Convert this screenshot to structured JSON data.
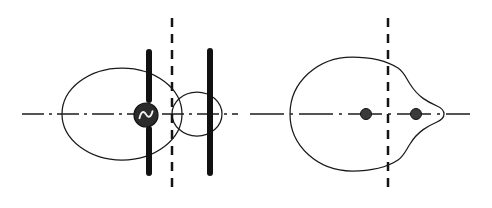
{
  "figure": {
    "background_color": "#ffffff",
    "width": 492,
    "height": 208,
    "stroke_color": "#1a1a1a",
    "electrode_color": "#111111",
    "dot_color": "#3a3a3a",
    "source_fill": "#2b2b2b",
    "source_wave_color": "#f2f2f2"
  },
  "panels": [
    {
      "id": "left-panel",
      "name": "ac-source-electrode-panel",
      "label": "AC source between split electrodes",
      "axis": {
        "name": "horizontal-axis",
        "style": "dash-dot",
        "y": 114,
        "x_start": 22,
        "x_end": 238
      },
      "symmetry_line": {
        "name": "symmetry-axis",
        "style": "dashed",
        "x": 172,
        "y_start": 18,
        "y_end": 192
      },
      "elements": [
        {
          "name": "large-oval-contour",
          "type": "oval",
          "cx": 122,
          "cy": 114,
          "rx": 60,
          "ry": 46
        },
        {
          "name": "small-lens-contour",
          "type": "oval",
          "cx": 197,
          "cy": 114,
          "rx": 25,
          "ry": 22
        },
        {
          "name": "upper-left-electrode",
          "type": "bar",
          "x": 149,
          "y_top": 49,
          "y_bottom": 103,
          "thickness": 6
        },
        {
          "name": "lower-left-electrode",
          "type": "bar",
          "x": 149,
          "y_top": 126,
          "y_bottom": 176,
          "thickness": 6
        },
        {
          "name": "right-electrode",
          "type": "bar",
          "x": 210,
          "y_top": 48,
          "y_bottom": 176,
          "thickness": 6
        },
        {
          "name": "ac-source-symbol",
          "type": "ac-source",
          "cx": 146,
          "cy": 115,
          "r": 12,
          "glyph": "sine-wave"
        }
      ]
    },
    {
      "id": "right-panel",
      "name": "equipotential-contour-panel",
      "label": "Equipotential contour with two charges",
      "axis": {
        "name": "horizontal-axis",
        "style": "dash-dot",
        "y": 114,
        "x_start": 250,
        "x_end": 470
      },
      "symmetry_line": {
        "name": "symmetry-axis",
        "style": "dashed",
        "x": 388,
        "y_start": 18,
        "y_end": 192
      },
      "elements": [
        {
          "name": "teardrop-contour",
          "type": "circle-with-nose",
          "circle_cx": 347,
          "circle_cy": 114,
          "circle_r": 57,
          "nose_tip_x": 443,
          "nose_tip_y": 114
        },
        {
          "name": "charge-dot-left",
          "type": "point-charge",
          "cx": 366,
          "cy": 114,
          "r": 5.5
        },
        {
          "name": "charge-dot-right",
          "type": "point-charge",
          "cx": 416,
          "cy": 114,
          "r": 5.5
        }
      ]
    }
  ]
}
